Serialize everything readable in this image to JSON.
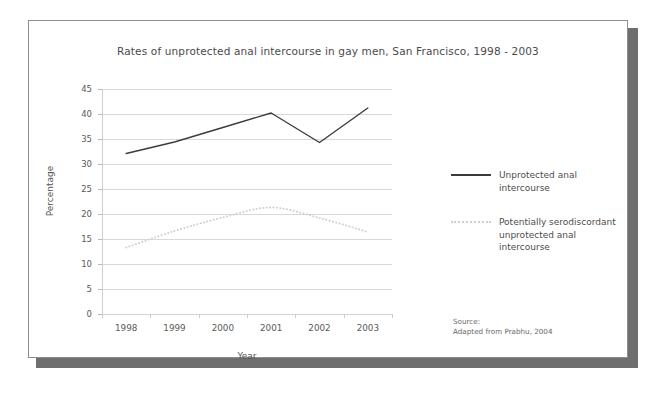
{
  "figure": {
    "title": "Rates of unprotected anal intercourse in gay men, San Francisco, 1998 - 2003",
    "frame_color": "#8d8d8d",
    "shadow_color": "#6e6e6e",
    "background_color": "#ffffff"
  },
  "axes": {
    "y_title": "Percentage",
    "x_title": "Year",
    "y_ticks": [
      "45",
      "40",
      "35",
      "30",
      "25",
      "20",
      "15",
      "10",
      "5",
      "0"
    ],
    "x_ticks": [
      "1998",
      "1999",
      "2000",
      "2001",
      "2002",
      "2003"
    ]
  },
  "legend": {
    "position": "right",
    "entries": [
      {
        "label": "Unprotected anal intercourse",
        "style": "solid",
        "color": "#3b3b3b",
        "swatch_icon": "solid-line-icon"
      },
      {
        "label": "Potentially serodiscordant unprotected anal intercourse",
        "style": "dotted",
        "color": "#d0d0d0",
        "swatch_icon": "dotted-line-icon"
      }
    ]
  },
  "source": {
    "line1": "Source:",
    "line2": "Adapted from Prabhu, 2004"
  },
  "chart_data": {
    "type": "line",
    "title": "Rates of unprotected anal intercourse in gay men, San Francisco, 1998 - 2003",
    "xlabel": "Year",
    "ylabel": "Percentage",
    "x": [
      "1998",
      "1999",
      "2000",
      "2001",
      "2002",
      "2003"
    ],
    "ylim": [
      0,
      45
    ],
    "ytick_step": 5,
    "xlim_categories": 6,
    "grid": "horizontal",
    "legend_position": "right",
    "series": [
      {
        "name": "Unprotected anal intercourse",
        "style": "solid",
        "color": "#3b3b3b",
        "smooth": false,
        "values": [
          32.1,
          34.4,
          37.3,
          40.2,
          34.3,
          41.2
        ]
      },
      {
        "name": "Potentially serodiscordant unprotected anal intercourse",
        "style": "dotted",
        "color": "#d0d0d0",
        "smooth": true,
        "values": [
          13.3,
          16.6,
          19.3,
          21.3,
          19.2,
          16.4
        ]
      }
    ],
    "annotations": [
      "Source:",
      "Adapted from Prabhu, 2004"
    ]
  }
}
